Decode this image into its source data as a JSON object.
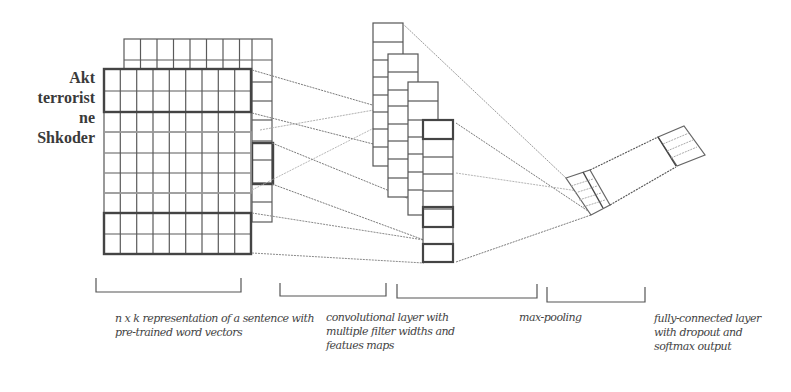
{
  "figure": {
    "words": [
      "Akt",
      "terrorist",
      "ne",
      "Shkoder"
    ],
    "captions": {
      "input": "n x k representation of a sentence with pre-trained word vectors",
      "convolution": "convolutional layer with multiple filter widths and featues maps",
      "pooling": "max-pooling",
      "fully_connected": "fully-connected layer with dropout and softmax output"
    },
    "input_matrix": {
      "rows": 9,
      "cols": 9
    },
    "colors": {
      "stroke": "#555555",
      "thick_stroke": "#444444",
      "line": "#8a8a8a",
      "light_line": "#b5b5b5",
      "text": "#444444"
    }
  }
}
